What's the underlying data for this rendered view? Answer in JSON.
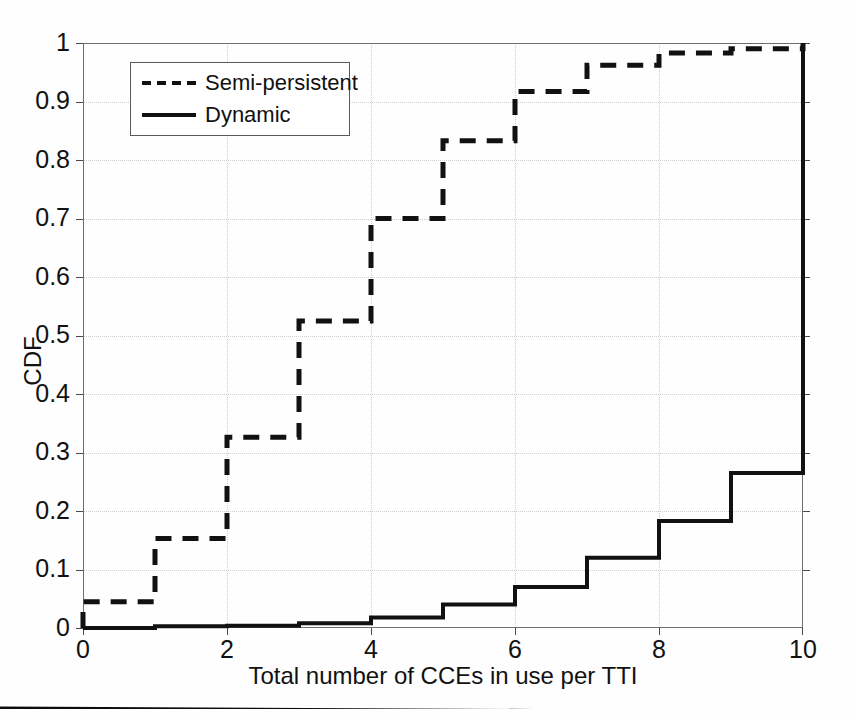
{
  "figure": {
    "background_color": "#fefefe",
    "axis_color": "#6e6e6e",
    "grid_color": "#cfcfcf",
    "series_color": "#111111"
  },
  "axes": {
    "y_label": "CDF",
    "x_label": "Total number of CCEs in use per TTI",
    "y_ticks": [
      "0",
      "0.1",
      "0.2",
      "0.3",
      "0.4",
      "0.5",
      "0.6",
      "0.7",
      "0.8",
      "0.9",
      "1"
    ],
    "x_ticks": [
      "0",
      "2",
      "4",
      "6",
      "8",
      "10"
    ]
  },
  "legend": {
    "items": [
      {
        "label": "Semi-persistent",
        "style": "dashed",
        "sample": "dashed-line-sample"
      },
      {
        "label": "Dynamic",
        "style": "solid",
        "sample": "solid-line-sample"
      }
    ]
  },
  "chart_data": {
    "type": "line",
    "title": "",
    "subtitle": "",
    "xlabel": "Total number of CCEs in use per TTI",
    "ylabel": "CDF",
    "xlim": [
      0,
      10
    ],
    "ylim": [
      0,
      1
    ],
    "xticks": [
      0,
      2,
      4,
      6,
      8,
      10
    ],
    "yticks": [
      0,
      0.1,
      0.2,
      0.3,
      0.4,
      0.5,
      0.6,
      0.7,
      0.8,
      0.9,
      1
    ],
    "grid": true,
    "legend_position": "upper-left",
    "step_style": "post",
    "x": [
      0,
      1,
      2,
      3,
      4,
      5,
      6,
      7,
      8,
      9,
      10
    ],
    "series": [
      {
        "name": "Semi-persistent",
        "style": "dashed",
        "color": "#111111",
        "values": [
          0.045,
          0.153,
          0.326,
          0.525,
          0.7,
          0.833,
          0.917,
          0.962,
          0.983,
          0.99,
          0.99
        ]
      },
      {
        "name": "Dynamic",
        "style": "solid",
        "color": "#111111",
        "values": [
          0.0,
          0.003,
          0.004,
          0.008,
          0.018,
          0.04,
          0.07,
          0.12,
          0.183,
          0.265,
          0.265
        ]
      }
    ],
    "annotations": [
      "Both curves terminate with a vertical rise to CDF = 1 at x = 10."
    ]
  }
}
